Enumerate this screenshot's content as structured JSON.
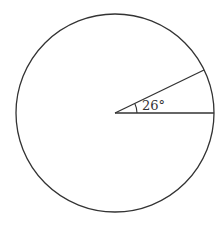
{
  "diagram": {
    "type": "circle-with-central-angle",
    "angle_label": "26°",
    "angle_degrees": 26,
    "stroke_color": "#333333",
    "background": "#ffffff",
    "circle": {
      "cx": 115,
      "cy": 113,
      "r": 99
    }
  }
}
